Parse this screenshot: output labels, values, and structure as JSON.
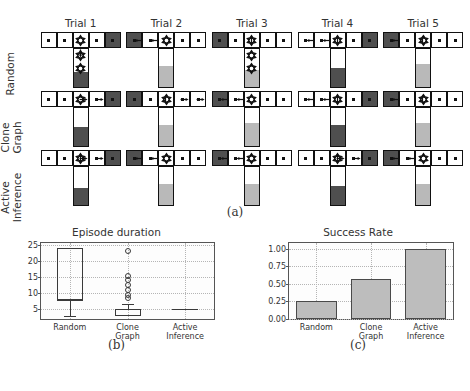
{
  "panel_a": {
    "caption": "(a)",
    "column_headers": [
      "Trial 1",
      "Trial 2",
      "Trial 3",
      "Trial 4",
      "Trial 5"
    ],
    "row_labels": [
      {
        "line1": "Random",
        "line2": ""
      },
      {
        "line1": "Clone",
        "line2": "Graph"
      },
      {
        "line1": "Active",
        "line2": "Inference"
      }
    ],
    "legend_colors": {
      "wall_dark": "#4f4f4f",
      "corridor_white": "#ffffff",
      "reward_light": "#b9b9b9",
      "outline": "#111111"
    },
    "mazes": [
      {
        "row": "Random",
        "trial": "Trial 1",
        "arm": [
          "white",
          "white",
          "junction",
          "white",
          "dark"
        ],
        "stem_fill": "dark",
        "stem_fill_pct": 40,
        "agent_pos": "junction",
        "extra_agents": [
          "stem-upper",
          "stem-lower"
        ],
        "arrows": [
          "down"
        ]
      },
      {
        "row": "Random",
        "trial": "Trial 2",
        "arm": [
          "dark",
          "white",
          "junction",
          "white",
          "white"
        ],
        "stem_fill": "light",
        "stem_fill_pct": 55,
        "agent_pos": "junction",
        "extra_agents": [],
        "arrows": [
          "left",
          "left"
        ]
      },
      {
        "row": "Random",
        "trial": "Trial 3",
        "arm": [
          "dark",
          "white",
          "junction",
          "white",
          "white"
        ],
        "stem_fill": "light",
        "stem_fill_pct": 45,
        "agent_pos": "junction",
        "extra_agents": [
          "stem-upper",
          "stem-lower"
        ],
        "arrows": [
          "up"
        ]
      },
      {
        "row": "Random",
        "trial": "Trial 4",
        "arm": [
          "white",
          "white",
          "junction",
          "white",
          "dark"
        ],
        "stem_fill": "dark",
        "stem_fill_pct": 50,
        "agent_pos": "junction",
        "extra_agents": [],
        "arrows": [
          "left",
          "left",
          "up"
        ]
      },
      {
        "row": "Random",
        "trial": "Trial 5",
        "arm": [
          "dark",
          "white",
          "junction",
          "white",
          "white"
        ],
        "stem_fill": "light",
        "stem_fill_pct": 60,
        "agent_pos": "junction",
        "extra_agents": [],
        "arrows": [
          "left",
          "up"
        ]
      },
      {
        "row": "Clone Graph",
        "trial": "Trial 1",
        "arm": [
          "white",
          "white",
          "junction",
          "white",
          "dark"
        ],
        "stem_fill": "dark",
        "stem_fill_pct": 50,
        "agent_pos": "junction",
        "extra_agents": [],
        "arrows": [
          "right",
          "right"
        ]
      },
      {
        "row": "Clone Graph",
        "trial": "Trial 2",
        "arm": [
          "dark",
          "white",
          "junction",
          "white",
          "white"
        ],
        "stem_fill": "light",
        "stem_fill_pct": 55,
        "agent_pos": "junction",
        "extra_agents": [],
        "arrows": [
          "up",
          "right",
          "right"
        ]
      },
      {
        "row": "Clone Graph",
        "trial": "Trial 3",
        "arm": [
          "dark",
          "white",
          "junction",
          "white",
          "white"
        ],
        "stem_fill": "light",
        "stem_fill_pct": 60,
        "agent_pos": "junction",
        "extra_agents": [],
        "arrows": [
          "left",
          "left"
        ]
      },
      {
        "row": "Clone Graph",
        "trial": "Trial 4",
        "arm": [
          "white",
          "white",
          "junction",
          "white",
          "dark"
        ],
        "stem_fill": "dark",
        "stem_fill_pct": 55,
        "agent_pos": "junction",
        "extra_agents": [],
        "arrows": [
          "left",
          "left",
          "up"
        ]
      },
      {
        "row": "Clone Graph",
        "trial": "Trial 5",
        "arm": [
          "dark",
          "white",
          "junction",
          "white",
          "white"
        ],
        "stem_fill": "light",
        "stem_fill_pct": 60,
        "agent_pos": "junction",
        "extra_agents": [],
        "arrows": [
          "left",
          "up"
        ]
      },
      {
        "row": "Active Inference",
        "trial": "Trial 1",
        "arm": [
          "white",
          "white",
          "junction",
          "white",
          "dark"
        ],
        "stem_fill": "dark",
        "stem_fill_pct": 45,
        "agent_pos": "junction",
        "extra_agents": [],
        "arrows": [
          "right",
          "right",
          "up"
        ]
      },
      {
        "row": "Active Inference",
        "trial": "Trial 2",
        "arm": [
          "dark",
          "white",
          "junction",
          "white",
          "white"
        ],
        "stem_fill": "light",
        "stem_fill_pct": 55,
        "agent_pos": "junction",
        "extra_agents": [],
        "arrows": [
          "left",
          "left"
        ]
      },
      {
        "row": "Active Inference",
        "trial": "Trial 3",
        "arm": [
          "dark",
          "white",
          "junction",
          "white",
          "white"
        ],
        "stem_fill": "light",
        "stem_fill_pct": 55,
        "agent_pos": "junction",
        "extra_agents": [],
        "arrows": [
          "left",
          "left"
        ]
      },
      {
        "row": "Active Inference",
        "trial": "Trial 4",
        "arm": [
          "white",
          "white",
          "junction",
          "white",
          "dark"
        ],
        "stem_fill": "dark",
        "stem_fill_pct": 50,
        "agent_pos": "junction",
        "extra_agents": [],
        "arrows": [
          "right",
          "right",
          "up"
        ]
      },
      {
        "row": "Active Inference",
        "trial": "Trial 5",
        "arm": [
          "dark",
          "white",
          "junction",
          "white",
          "white"
        ],
        "stem_fill": "light",
        "stem_fill_pct": 55,
        "agent_pos": "junction",
        "extra_agents": [],
        "arrows": [
          "left",
          "left"
        ]
      }
    ]
  },
  "chart_data": [
    {
      "panel": "(b)",
      "type": "box",
      "title": "Episode duration",
      "xlabel": "",
      "ylabel": "",
      "categories": [
        "Random",
        "Clone Graph",
        "Active Inference"
      ],
      "category_lines": [
        [
          "Random",
          ""
        ],
        [
          "Clone",
          "Graph"
        ],
        [
          "Active",
          "Inference"
        ]
      ],
      "ylim": [
        2,
        25.5
      ],
      "yticks": [
        5,
        10,
        15,
        20,
        25
      ],
      "grid": true,
      "boxes": [
        {
          "name": "Random",
          "whisker_low": 3,
          "q1": 8,
          "median": 8,
          "q3": 24,
          "whisker_high": 24,
          "fliers": []
        },
        {
          "name": "Clone Graph",
          "whisker_low": 3,
          "q1": 3,
          "median": 5,
          "q3": 5,
          "whisker_high": 6.5,
          "fliers": [
            8.5,
            9.5,
            11,
            12.5,
            14,
            15.2,
            23
          ]
        },
        {
          "name": "Active Inference",
          "whisker_low": 5,
          "q1": 5,
          "median": 5,
          "q3": 5,
          "whisker_high": 5,
          "fliers": []
        }
      ]
    },
    {
      "panel": "(c)",
      "type": "bar",
      "title": "Success Rate",
      "xlabel": "",
      "ylabel": "",
      "categories": [
        "Random",
        "Clone Graph",
        "Active Inference"
      ],
      "category_lines": [
        [
          "Random",
          ""
        ],
        [
          "Clone",
          "Graph"
        ],
        [
          "Active",
          "Inference"
        ]
      ],
      "values": [
        0.25,
        0.57,
        1.0
      ],
      "ylim": [
        0.0,
        1.08
      ],
      "yticks": [
        0.0,
        0.25,
        0.5,
        0.75,
        1.0
      ],
      "ytick_labels": [
        "0.00",
        "0.25",
        "0.50",
        "0.75",
        "1.00"
      ],
      "grid": true,
      "bar_color": "#bdbdbd",
      "bar_edge": "#4a4a4a"
    }
  ],
  "captions": {
    "b": "(b)",
    "c": "(c)"
  }
}
